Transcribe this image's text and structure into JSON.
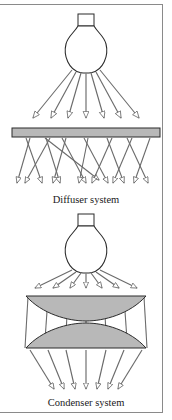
{
  "figure": {
    "background_color": "#ffffff",
    "frame": {
      "border_color": "#8a8a8a",
      "top_border": true,
      "right_border": true,
      "bottom_border": true,
      "left_border": false
    },
    "stroke_color": "#5a5a5a",
    "outline_color": "#2b2b2b",
    "gray_fill": "#b8b8b8",
    "panels": [
      {
        "id": "diffuser",
        "caption": "Diffuser system",
        "caption_x": 86,
        "caption_y": 203,
        "lamp": {
          "name": "light-bulb",
          "cap_x": 78,
          "cap_y": 14,
          "cap_w": 16,
          "cap_h": 11,
          "bulb_cx": 86,
          "bulb_cy": 49,
          "bulb_rx": 21,
          "bulb_ry": 23
        },
        "element": {
          "type": "flat-diffuser-plate",
          "x": 12,
          "y": 128,
          "width": 148,
          "height": 9,
          "fill": "#b8b8b8"
        },
        "incident_ray_count": 7,
        "scattered_ray_count": 14,
        "behavior": "incident rays strike the flat diffuser plate and are scattered into crossing, randomized directions"
      },
      {
        "id": "condenser",
        "caption": "Condenser system",
        "caption_x": 86,
        "caption_y": 406,
        "lamp": {
          "name": "light-bulb",
          "cap_x": 78,
          "cap_y": 214,
          "cap_w": 16,
          "cap_h": 11,
          "bulb_cx": 86,
          "bulb_cy": 249,
          "bulb_rx": 21,
          "bulb_ry": 23
        },
        "elements": [
          {
            "type": "plano-convex-lens-top",
            "left": 26,
            "right": 146,
            "flat_y": 296,
            "bulge_y": 318,
            "orientation": "flat top, convex bottom",
            "fill": "#b8b8b8"
          },
          {
            "type": "plano-convex-lens-bottom",
            "left": 26,
            "right": 146,
            "flat_y": 348,
            "bulge_y": 326,
            "orientation": "convex top, flat bottom",
            "fill": "#b8b8b8"
          }
        ],
        "incident_ray_count": 7,
        "output_ray_count": 7,
        "behavior": "diverging rays from the lamp are collected by the two condenser lenses and converged into a collimated, concentrated beam"
      }
    ]
  }
}
